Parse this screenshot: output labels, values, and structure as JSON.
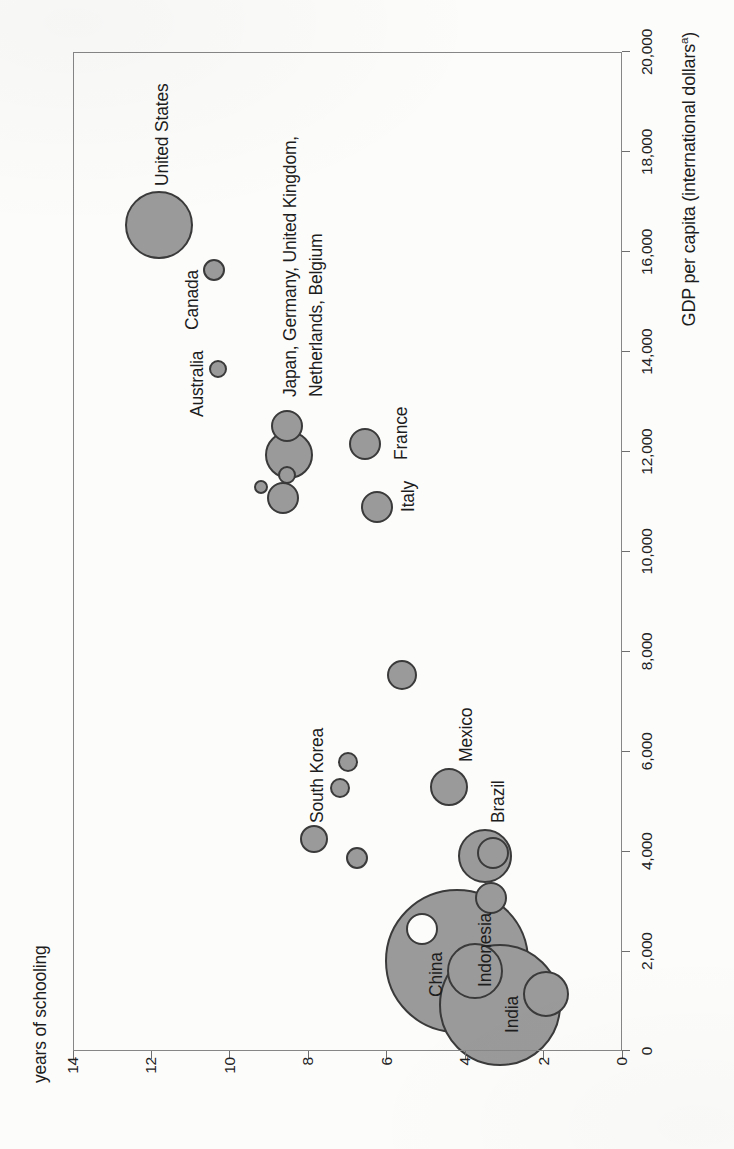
{
  "page": {
    "width_px": 734,
    "height_px": 1149,
    "background": "#fcfcfb",
    "orientation_note": "bubble chart rotated 90 degrees counterclockwise on a portrait scanned page"
  },
  "style": {
    "bubble_fill": "#9a9a9a",
    "bubble_fill_white": "#fcfcfb",
    "bubble_stroke": "#3a3a3a",
    "axis_color": "#868686",
    "text_color": "#1d1d1d"
  },
  "chart_data": {
    "type": "scatter",
    "subtype": "bubble",
    "title": "",
    "xlabel": "GDP per capita (international dollars^a)",
    "xlabel_parts": {
      "main": "GDP per capita (international dollars",
      "superscript": "a",
      "close": ")"
    },
    "ylabel": "years of schooling",
    "xlim": [
      0,
      20000
    ],
    "ylim": [
      0,
      14
    ],
    "grid": false,
    "legend": "none; bubble area proportional to country size",
    "x_ticks": [
      {
        "label": "0",
        "value": 0
      },
      {
        "label": "2,000",
        "value": 2000
      },
      {
        "label": "4,000",
        "value": 4000
      },
      {
        "label": "6,000",
        "value": 6000
      },
      {
        "label": "8,000",
        "value": 8000
      },
      {
        "label": "10,000",
        "value": 10000
      },
      {
        "label": "12,000",
        "value": 12000
      },
      {
        "label": "14,000",
        "value": 14000
      },
      {
        "label": "16,000",
        "value": 16000
      },
      {
        "label": "18,000",
        "value": 18000
      },
      {
        "label": "20,000",
        "value": 20000
      }
    ],
    "y_ticks": [
      {
        "label": "0",
        "value": 0
      },
      {
        "label": "2",
        "value": 2
      },
      {
        "label": "4",
        "value": 4
      },
      {
        "label": "6",
        "value": 6
      },
      {
        "label": "8",
        "value": 8
      },
      {
        "label": "10",
        "value": 10
      },
      {
        "label": "12",
        "value": 12
      },
      {
        "label": "14",
        "value": 14
      }
    ],
    "bubbles": [
      {
        "id": "china",
        "label": "China",
        "gdp": 1800,
        "schooling": 4.2,
        "r": 72,
        "fill": "gray"
      },
      {
        "id": "india",
        "label": "India",
        "gdp": 920,
        "schooling": 3.1,
        "r": 61,
        "fill": "gray"
      },
      {
        "id": "united-states",
        "label": "United States",
        "gdp": 16540,
        "schooling": 11.8,
        "r": 34,
        "fill": "gray"
      },
      {
        "id": "indonesia",
        "label": "Indonesia",
        "gdp": 1600,
        "schooling": 3.75,
        "r": 28,
        "fill": "gray"
      },
      {
        "id": "brazil",
        "label": "Brazil",
        "gdp": 3900,
        "schooling": 3.5,
        "r": 27,
        "fill": "gray"
      },
      {
        "id": "cluster-largest",
        "label": "",
        "gdp": 11930,
        "schooling": 8.5,
        "r": 24,
        "fill": "gray"
      },
      {
        "id": "unlabeled-lowest-schooling",
        "label": "",
        "gdp": 1140,
        "schooling": 1.95,
        "r": 23,
        "fill": "gray"
      },
      {
        "id": "mexico",
        "label": "Mexico",
        "gdp": 5290,
        "schooling": 4.4,
        "r": 19,
        "fill": "gray"
      },
      {
        "id": "cluster-upper-right",
        "label": "",
        "gdp": 12510,
        "schooling": 8.55,
        "r": 16,
        "fill": "gray"
      },
      {
        "id": "cluster-lower",
        "label": "",
        "gdp": 11070,
        "schooling": 8.65,
        "r": 16,
        "fill": "gray"
      },
      {
        "id": "france",
        "label": "France",
        "gdp": 12150,
        "schooling": 6.55,
        "r": 16,
        "fill": "gray"
      },
      {
        "id": "italy",
        "label": "Italy",
        "gdp": 10890,
        "schooling": 6.25,
        "r": 16,
        "fill": "gray"
      },
      {
        "id": "unlabeled-over-brazil",
        "label": "",
        "gdp": 3960,
        "schooling": 3.3,
        "r": 16,
        "fill": "gray"
      },
      {
        "id": "unlabeled-below-brazil",
        "label": "",
        "gdp": 3060,
        "schooling": 3.35,
        "r": 16,
        "fill": "gray"
      },
      {
        "id": "unlabeled-white-over-china",
        "label": "",
        "gdp": 2440,
        "schooling": 5.1,
        "r": 16,
        "fill": "white"
      },
      {
        "id": "unlabeled-middle",
        "label": "",
        "gdp": 7530,
        "schooling": 5.6,
        "r": 15,
        "fill": "gray"
      },
      {
        "id": "south-korea",
        "label": "South Korea",
        "gdp": 4240,
        "schooling": 7.85,
        "r": 14,
        "fill": "gray"
      },
      {
        "id": "canada",
        "label": "Canada",
        "gdp": 15640,
        "schooling": 10.4,
        "r": 11,
        "fill": "gray"
      },
      {
        "id": "unlabeled-left-of-brazil",
        "label": "",
        "gdp": 3860,
        "schooling": 6.75,
        "r": 11,
        "fill": "gray"
      },
      {
        "id": "unlabeled-above-south-korea-1",
        "label": "",
        "gdp": 5790,
        "schooling": 7.0,
        "r": 10,
        "fill": "gray"
      },
      {
        "id": "unlabeled-above-south-korea-2",
        "label": "",
        "gdp": 5270,
        "schooling": 7.2,
        "r": 10,
        "fill": "gray"
      },
      {
        "id": "australia",
        "label": "Australia",
        "gdp": 13650,
        "schooling": 10.3,
        "r": 9,
        "fill": "gray"
      },
      {
        "id": "cluster-small",
        "label": "",
        "gdp": 11530,
        "schooling": 8.55,
        "r": 9,
        "fill": "gray"
      },
      {
        "id": "cluster-smallest",
        "label": "",
        "gdp": 11290,
        "schooling": 9.2,
        "r": 7,
        "fill": "gray"
      }
    ],
    "annotations": [
      {
        "id": "united-states-label",
        "text": "United States",
        "x": 963,
        "y": 162
      },
      {
        "id": "canada-label",
        "text": "Canada",
        "x": 819,
        "y": 192
      },
      {
        "id": "australia-label",
        "text": "Australia",
        "x": 732,
        "y": 197
      },
      {
        "id": "cluster-label-line1",
        "text": "Japan, Germany, United Kingdom,",
        "x": 752,
        "y": 290
      },
      {
        "id": "cluster-label-line2",
        "text": "Netherlands, Belgium",
        "x": 752,
        "y": 316
      },
      {
        "id": "france-label",
        "text": "France",
        "x": 689,
        "y": 401
      },
      {
        "id": "italy-label",
        "text": "Italy",
        "x": 637,
        "y": 408
      },
      {
        "id": "south-korea-label",
        "text": "South Korea",
        "x": 326,
        "y": 317
      },
      {
        "id": "mexico-label",
        "text": "Mexico",
        "x": 387,
        "y": 466
      },
      {
        "id": "brazil-label",
        "text": "Brazil",
        "x": 326,
        "y": 498
      },
      {
        "id": "china-label",
        "text": "China",
        "x": 152,
        "y": 436
      },
      {
        "id": "indonesia-label",
        "text": "Indonesia",
        "x": 162,
        "y": 485
      },
      {
        "id": "india-label",
        "text": "India",
        "x": 116,
        "y": 512
      }
    ],
    "plot_geometry": {
      "left": 98,
      "top": 73,
      "width": 999,
      "height": 549
    }
  }
}
